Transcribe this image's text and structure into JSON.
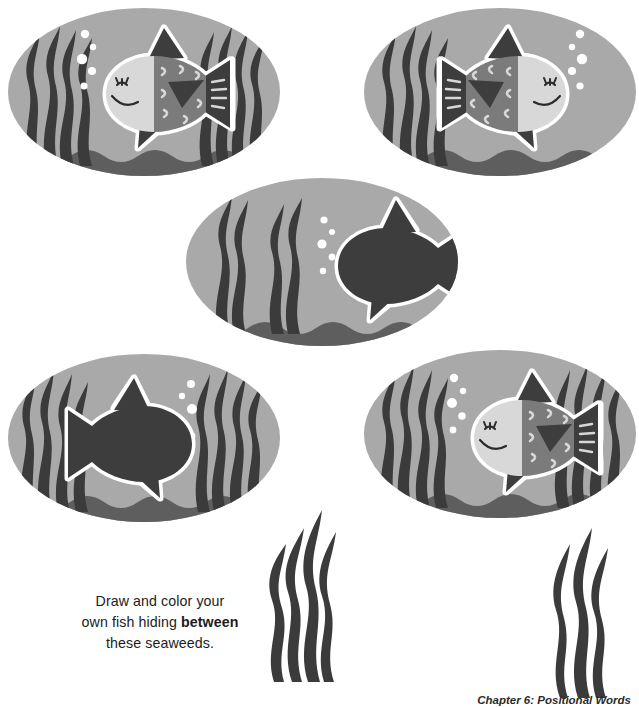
{
  "page": {
    "width": 639,
    "height": 707,
    "background": "#ffffff"
  },
  "palette": {
    "water": "#a9a9a9",
    "seabed": "#5e5e5e",
    "seaweed_dark": "#3b3b3b",
    "seaweed_mid": "#4a4a4a",
    "fish_dark": "#3d3d3d",
    "fish_mid": "#7b7b7b",
    "fish_light": "#d8d8d8",
    "fish_outline": "#ffffff",
    "bubble": "#ffffff",
    "text": "#1c1c1c",
    "caption": "#2b2b2b"
  },
  "prompt": {
    "line1": "Draw and color your",
    "line2_pre": "own fish hiding ",
    "line2_strong": "between",
    "line3": "these seaweeds."
  },
  "footer": {
    "caption": "Chapter 6: Positional Words"
  },
  "scenes": [
    {
      "id": "scene-top-left",
      "name": "fish-scene-top-left",
      "x": 6,
      "y": 6,
      "width": 276,
      "height": 172,
      "fish_style": "patterned",
      "fish_direction": "left",
      "bubbles": 5,
      "bubble_side": "left",
      "weeds": [
        "left",
        "right"
      ]
    },
    {
      "id": "scene-top-right",
      "name": "fish-scene-top-right",
      "x": 362,
      "y": 6,
      "width": 276,
      "height": 172,
      "fish_style": "patterned",
      "fish_direction": "right",
      "bubbles": 5,
      "bubble_side": "right",
      "weeds": [
        "left"
      ]
    },
    {
      "id": "scene-middle",
      "name": "fish-scene-middle",
      "x": 184,
      "y": 176,
      "width": 276,
      "height": 172,
      "fish_style": "silhouette",
      "fish_direction": "left",
      "bubbles": 5,
      "bubble_side": "center",
      "weeds": [
        "left-inner"
      ]
    },
    {
      "id": "scene-bottom-left",
      "name": "fish-scene-bottom-left",
      "x": 6,
      "y": 352,
      "width": 276,
      "height": 172,
      "fish_style": "silhouette",
      "fish_direction": "right",
      "bubbles": 5,
      "bubble_side": "right-inner",
      "weeds": [
        "left",
        "right"
      ]
    },
    {
      "id": "scene-bottom-right",
      "name": "fish-scene-bottom-right",
      "x": 362,
      "y": 348,
      "width": 276,
      "height": 172,
      "fish_style": "patterned",
      "fish_direction": "left",
      "bubbles": 5,
      "bubble_side": "left",
      "weeds": [
        "left",
        "right"
      ]
    }
  ],
  "standalone_weeds": [
    {
      "id": "weed-cluster-center",
      "name": "seaweed-cluster-center",
      "x": 252,
      "y": 496,
      "width": 112,
      "height": 186,
      "blades": 4
    },
    {
      "id": "weed-cluster-right",
      "name": "seaweed-cluster-right",
      "x": 538,
      "y": 518,
      "width": 88,
      "height": 172,
      "blades": 3
    }
  ]
}
